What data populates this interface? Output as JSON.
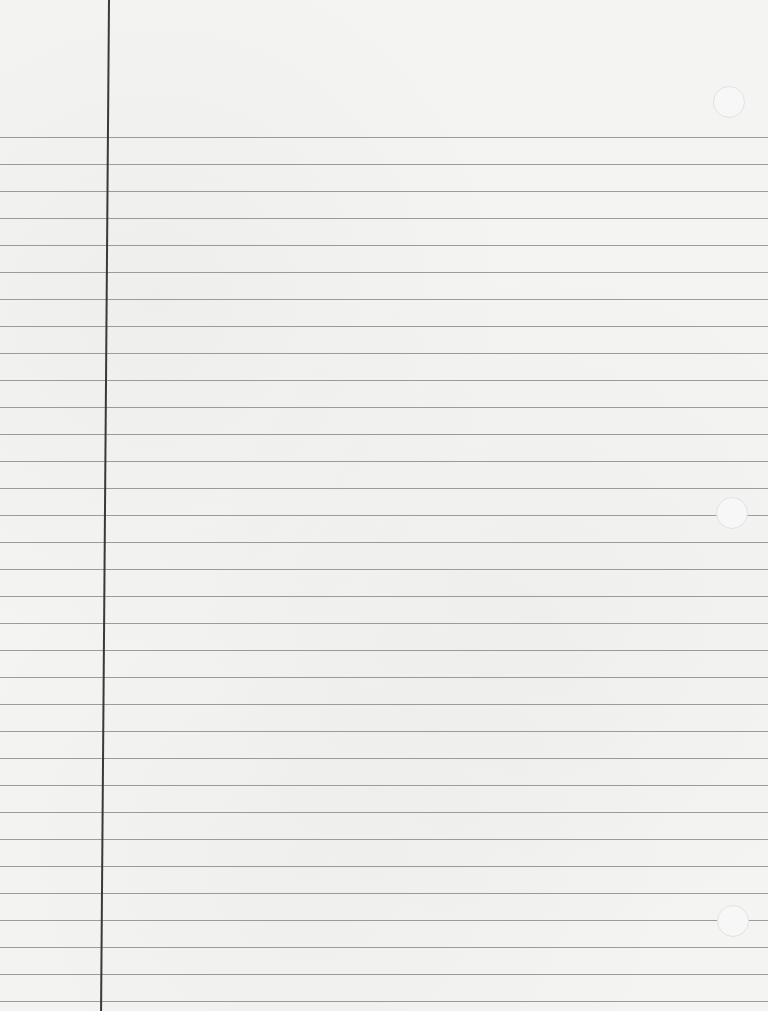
{
  "paper": {
    "type": "lined notebook paper",
    "background_color": "#f4f4f3",
    "rule_color": "#8c8c8c",
    "margin_color": "#3a3a3a",
    "first_rule_y": 137,
    "rule_spacing": 27,
    "rule_count": 33,
    "margin_x": 108,
    "holes": [
      {
        "x": 713,
        "y": 86
      },
      {
        "x": 716,
        "y": 497
      },
      {
        "x": 717,
        "y": 905
      }
    ]
  }
}
